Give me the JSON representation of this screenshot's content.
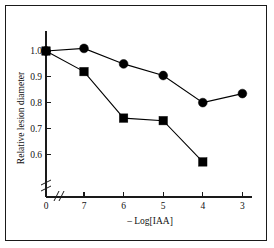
{
  "chart_data": {
    "type": "line",
    "title": "",
    "xlabel": "– Log[IAA]",
    "ylabel": "Relative lesion diameter",
    "x_tick_labels": [
      "0",
      "7",
      "6",
      "5",
      "4",
      "3"
    ],
    "y_tick_labels": [
      "1.0",
      "0.9",
      "0.8",
      "0.7",
      "0.6"
    ],
    "y_tick_values": [
      1.0,
      0.9,
      0.8,
      0.7,
      0.6
    ],
    "ylim": [
      0.55,
      1.03
    ],
    "xlim_categories": [
      "0",
      "7",
      "6",
      "5",
      "4",
      "3"
    ],
    "grid": false,
    "legend": "none",
    "x_axis_break": true,
    "x_axis_break_between": [
      "0",
      "7"
    ],
    "y_axis_break": true,
    "y_axis_break_below": 0.6,
    "series": [
      {
        "name": "circles",
        "marker": "filled-circle",
        "x": [
          "0",
          "7",
          "6",
          "5",
          "4",
          "3"
        ],
        "values": [
          1.0,
          1.01,
          0.95,
          0.905,
          0.8,
          0.835
        ]
      },
      {
        "name": "squares",
        "marker": "filled-square",
        "x": [
          "0",
          "7",
          "6",
          "5",
          "4"
        ],
        "values": [
          1.0,
          0.92,
          0.74,
          0.73,
          0.57
        ]
      }
    ]
  },
  "figure": {
    "background_color": "#ffffff",
    "border_color": "#1a1a1a",
    "ink_color": "#000000"
  }
}
